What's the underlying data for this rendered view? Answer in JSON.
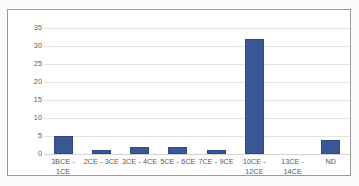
{
  "chart_data": {
    "type": "bar",
    "title": "",
    "subtitle": "",
    "xlabel": "",
    "ylabel": "",
    "categories": [
      "3BCE - 1CE",
      "2CE - 3CE",
      "3CE - 4CE",
      "5CE - 6CE",
      "7CE - 9CE",
      "10CE - 12CE",
      "13CE - 14CE",
      "ND"
    ],
    "values": [
      5,
      1,
      2,
      2,
      1,
      32,
      0,
      4
    ],
    "ylim": [
      0,
      35
    ],
    "yticks": [
      0,
      5,
      10,
      15,
      20,
      25,
      30,
      35
    ],
    "ytick_labels": [
      "0",
      "5",
      "10",
      "15",
      "20",
      "25",
      "30",
      "35"
    ],
    "grid": true,
    "legend": false,
    "legend_position": "none",
    "bar_color": "#3b5896",
    "gridline_color": "#e3e3e3",
    "axis_text_color": "#585858",
    "frame_color": "#9a9a9a",
    "plot_background": "#ffffff"
  }
}
